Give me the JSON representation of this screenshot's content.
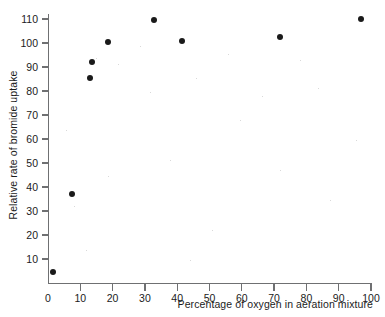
{
  "chart_data": {
    "type": "scatter",
    "title": "",
    "xlabel": "Percentage of oxygen in aeration mixture",
    "ylabel": "Relative rate of bromide uptake",
    "xlim": [
      0,
      100
    ],
    "ylim": [
      0,
      113
    ],
    "grid": false,
    "legend": null,
    "x_ticks": [
      0,
      10,
      20,
      30,
      40,
      50,
      60,
      70,
      80,
      90,
      100
    ],
    "y_ticks": [
      10,
      20,
      30,
      40,
      50,
      60,
      70,
      80,
      90,
      100,
      110
    ],
    "marker": "filled-circle",
    "marker_color": "#1a1a1a",
    "axis_color": "#6f7072",
    "points": [
      {
        "x": 1.5,
        "y": 4.5
      },
      {
        "x": 7.4,
        "y": 37
      },
      {
        "x": 13.0,
        "y": 85.5
      },
      {
        "x": 13.6,
        "y": 92
      },
      {
        "x": 18.6,
        "y": 100.5
      },
      {
        "x": 32.8,
        "y": 109.5
      },
      {
        "x": 41.5,
        "y": 101
      },
      {
        "x": 71.8,
        "y": 102.5
      },
      {
        "x": 97.0,
        "y": 110
      }
    ]
  }
}
